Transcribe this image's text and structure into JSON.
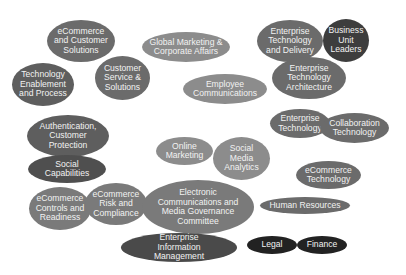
{
  "diagram": {
    "nodes": [
      {
        "id": "ecommerce-customer-solutions",
        "label": "eCommerce\nand Customer\nSolutions",
        "color": "#6b6b6b"
      },
      {
        "id": "global-marketing",
        "label": "Global Marketing &\nCorporate Affairs",
        "color": "#8c8c8c"
      },
      {
        "id": "enterprise-tech-delivery",
        "label": "Enterprise\nTechnology\nand Delivery",
        "color": "#6b6b6b"
      },
      {
        "id": "business-unit-leaders",
        "label": "Business\nUnit\nLeaders",
        "color": "#3d3d3d"
      },
      {
        "id": "tech-enablement",
        "label": "Technology\nEnablement\nand Process",
        "color": "#5e5e5e"
      },
      {
        "id": "customer-service",
        "label": "Customer\nService &\nSolutions",
        "color": "#6b6b6b"
      },
      {
        "id": "employee-communications",
        "label": "Employee\nCommunications",
        "color": "#8c8c8c"
      },
      {
        "id": "enterprise-tech-architecture",
        "label": "Enterprise\nTechnology\nArchitecture",
        "color": "#6b6b6b"
      },
      {
        "id": "authentication",
        "label": "Authentication,\nCustomer\nProtection",
        "color": "#5e5e5e"
      },
      {
        "id": "enterprise-technology",
        "label": "Enterprise\nTechnology",
        "color": "#6b6b6b"
      },
      {
        "id": "collaboration-technology",
        "label": "Collaboration\nTechnology",
        "color": "#6b6b6b"
      },
      {
        "id": "online-marketing",
        "label": "Online\nMarketing",
        "color": "#8c8c8c"
      },
      {
        "id": "social-media-analytics",
        "label": "Social\nMedia\nAnalytics",
        "color": "#8c8c8c"
      },
      {
        "id": "social-capabilities",
        "label": "Social\nCapabilities",
        "color": "#4f4f4f"
      },
      {
        "id": "ecommerce-technology",
        "label": "eCommerce\nTechnology",
        "color": "#6b6b6b"
      },
      {
        "id": "ecommerce-controls",
        "label": "eCommerce\nControls and\nReadiness",
        "color": "#7a7a7a"
      },
      {
        "id": "ecommerce-risk",
        "label": "eCommerce\nRisk and\nCompliance",
        "color": "#7a7a7a"
      },
      {
        "id": "electronic-communications",
        "label": "Electronic\nCommunications and\nMedia Governance\nCommittee",
        "color": "#7a7a7a"
      },
      {
        "id": "human-resources",
        "label": "Human Resources",
        "color": "#6b6b6b"
      },
      {
        "id": "enterprise-info-mgmt",
        "label": "Enterprise\nInformation\nManagement",
        "color": "#4a4a4a"
      },
      {
        "id": "legal",
        "label": "Legal",
        "color": "#222222"
      },
      {
        "id": "finance",
        "label": "Finance",
        "color": "#222222"
      }
    ]
  }
}
